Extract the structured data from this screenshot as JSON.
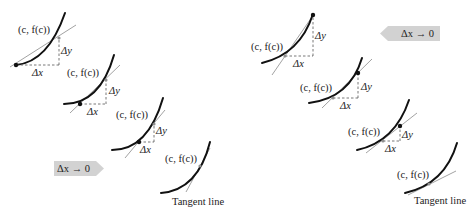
{
  "figure": {
    "left_sequence": {
      "panels": [
        {
          "point_label": "(c, f(c))",
          "dy_label": "Δy",
          "dx_label": "Δx"
        },
        {
          "point_label": "(c, f(c))",
          "dy_label": "Δy",
          "dx_label": "Δx"
        },
        {
          "point_label": "(c, f(c))",
          "dy_label": "Δy",
          "dx_label": "Δx"
        },
        {
          "point_label": "(c, f(c))",
          "caption": "Tangent line"
        }
      ],
      "arrow": {
        "label": "Δx → 0",
        "direction": "right"
      }
    },
    "right_sequence": {
      "panels": [
        {
          "point_label": "(c, f(c))",
          "dy_label": "Δy",
          "dx_label": "Δx"
        },
        {
          "point_label": "(c, f(c))",
          "dy_label": "Δy",
          "dx_label": "Δx"
        },
        {
          "point_label": "(c, f(c))",
          "dy_label": "Δy",
          "dx_label": "Δx"
        },
        {
          "point_label": "(c, f(c))",
          "caption": "Tangent line"
        }
      ],
      "arrow": {
        "label": "Δx → 0",
        "direction": "left"
      }
    },
    "colors": {
      "curve": "#111111",
      "secant": "#8a8a8a",
      "arrow_fill": "#d2d2d2"
    }
  }
}
